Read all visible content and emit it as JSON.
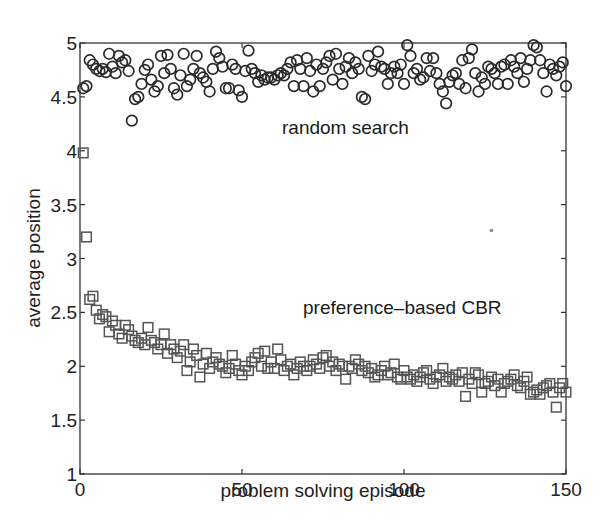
{
  "chart_data": {
    "type": "scatter",
    "title": "",
    "xlabel": "problem solving episode",
    "ylabel": "average position",
    "xlim": [
      0,
      150
    ],
    "ylim": [
      1,
      5
    ],
    "xticks": [
      0,
      50,
      100,
      150
    ],
    "yticks": [
      1,
      1.5,
      2,
      2.5,
      3,
      3.5,
      4,
      4.5,
      5
    ],
    "ytick_labels": [
      "1",
      "1.5",
      "2",
      "2.5",
      "3",
      "3.5",
      "4",
      "4.5",
      "5"
    ],
    "xtick_labels": [
      "0",
      "50",
      "100",
      "150"
    ],
    "grid": false,
    "legend": "none (inline annotations)",
    "annotations": [
      {
        "text": "random search",
        "x": 45,
        "y": 4.03
      },
      {
        "text": "preference–based CBR",
        "x": 65,
        "y": 2.28
      }
    ],
    "series": [
      {
        "name": "random search",
        "marker": "circle",
        "color": "#2a2a2a",
        "x": [
          1,
          2,
          3,
          4,
          5,
          6,
          7,
          8,
          9,
          10,
          11,
          12,
          13,
          14,
          15,
          16,
          17,
          18,
          19,
          20,
          21,
          22,
          23,
          24,
          25,
          26,
          27,
          28,
          29,
          30,
          31,
          32,
          33,
          34,
          35,
          36,
          37,
          38,
          39,
          40,
          41,
          42,
          43,
          44,
          45,
          46,
          47,
          48,
          49,
          50,
          51,
          52,
          53,
          54,
          55,
          56,
          57,
          58,
          59,
          60,
          61,
          62,
          63,
          64,
          65,
          66,
          67,
          68,
          69,
          70,
          71,
          72,
          73,
          74,
          75,
          76,
          77,
          78,
          79,
          80,
          81,
          82,
          83,
          84,
          85,
          86,
          87,
          88,
          89,
          90,
          91,
          92,
          93,
          94,
          95,
          96,
          97,
          98,
          99,
          100,
          101,
          102,
          103,
          104,
          105,
          106,
          107,
          108,
          109,
          110,
          111,
          112,
          113,
          114,
          115,
          116,
          117,
          118,
          119,
          120,
          121,
          122,
          123,
          124,
          125,
          126,
          127,
          128,
          129,
          130,
          131,
          132,
          133,
          134,
          135,
          136,
          137,
          138,
          139,
          140,
          141,
          142,
          143,
          144,
          145,
          146,
          147,
          148,
          149,
          150
        ],
        "y": [
          4.58,
          4.6,
          4.84,
          4.8,
          4.76,
          4.74,
          4.76,
          4.73,
          4.9,
          4.78,
          4.72,
          4.88,
          4.82,
          4.84,
          4.74,
          4.28,
          4.48,
          4.5,
          4.62,
          4.75,
          4.8,
          4.66,
          4.55,
          4.6,
          4.88,
          4.72,
          4.89,
          4.76,
          4.58,
          4.52,
          4.7,
          4.9,
          4.6,
          4.66,
          4.76,
          4.88,
          4.72,
          4.68,
          4.64,
          4.55,
          4.76,
          4.92,
          4.86,
          4.78,
          4.58,
          4.58,
          4.8,
          4.76,
          4.56,
          4.5,
          4.74,
          4.93,
          4.76,
          4.72,
          4.64,
          4.7,
          4.66,
          4.68,
          4.68,
          4.66,
          4.7,
          4.72,
          4.7,
          4.76,
          4.82,
          4.6,
          4.84,
          4.76,
          4.6,
          4.86,
          4.74,
          4.55,
          4.8,
          4.6,
          4.76,
          4.82,
          4.88,
          4.66,
          4.9,
          4.76,
          4.62,
          4.78,
          4.86,
          4.72,
          4.82,
          4.76,
          4.5,
          4.48,
          4.88,
          4.74,
          4.8,
          4.92,
          4.78,
          4.76,
          4.62,
          4.72,
          4.78,
          4.72,
          4.8,
          4.62,
          4.98,
          4.88,
          4.72,
          4.76,
          4.66,
          4.68,
          4.86,
          4.74,
          4.86,
          4.72,
          4.62,
          4.55,
          4.44,
          4.64,
          4.7,
          4.72,
          4.62,
          4.84,
          4.58,
          4.86,
          4.94,
          4.72,
          4.55,
          4.68,
          4.62,
          4.78,
          4.76,
          4.72,
          4.62,
          4.78,
          4.8,
          4.62,
          4.84,
          4.78,
          4.72,
          4.86,
          4.64,
          4.76,
          4.84,
          4.98,
          4.96,
          4.84,
          4.72,
          4.55,
          4.8,
          4.76,
          4.7,
          4.78,
          4.82,
          4.6
        ],
        "y_range_observed": [
          4.28,
          5.0
        ]
      },
      {
        "name": "preference-based CBR",
        "marker": "square",
        "color": "#555555",
        "x": [
          1,
          2,
          3,
          4,
          5,
          6,
          7,
          8,
          9,
          10,
          11,
          12,
          13,
          14,
          15,
          16,
          17,
          18,
          19,
          20,
          21,
          22,
          23,
          24,
          25,
          26,
          27,
          28,
          29,
          30,
          31,
          32,
          33,
          34,
          35,
          36,
          37,
          38,
          39,
          40,
          41,
          42,
          43,
          44,
          45,
          46,
          47,
          48,
          49,
          50,
          51,
          52,
          53,
          54,
          55,
          56,
          57,
          58,
          59,
          60,
          61,
          62,
          63,
          64,
          65,
          66,
          67,
          68,
          69,
          70,
          71,
          72,
          73,
          74,
          75,
          76,
          77,
          78,
          79,
          80,
          81,
          82,
          83,
          84,
          85,
          86,
          87,
          88,
          89,
          90,
          91,
          92,
          93,
          94,
          95,
          96,
          97,
          98,
          99,
          100,
          101,
          102,
          103,
          104,
          105,
          106,
          107,
          108,
          109,
          110,
          111,
          112,
          113,
          114,
          115,
          116,
          117,
          118,
          119,
          120,
          121,
          122,
          123,
          124,
          125,
          126,
          127,
          128,
          129,
          130,
          131,
          132,
          133,
          134,
          135,
          136,
          137,
          138,
          139,
          140,
          141,
          142,
          143,
          144,
          145,
          146,
          147,
          148,
          149,
          150
        ],
        "y": [
          3.98,
          3.2,
          2.62,
          2.65,
          2.52,
          2.44,
          2.48,
          2.46,
          2.32,
          2.42,
          2.38,
          2.3,
          2.26,
          2.38,
          2.34,
          2.28,
          2.24,
          2.22,
          2.26,
          2.2,
          2.36,
          2.24,
          2.22,
          2.16,
          2.2,
          2.3,
          2.12,
          2.2,
          2.16,
          2.08,
          2.14,
          2.2,
          1.96,
          2.04,
          2.16,
          2.1,
          1.9,
          2.02,
          2.12,
          1.98,
          2.04,
          2.08,
          2.02,
          2.0,
          1.94,
          1.98,
          2.1,
          2.02,
          1.96,
          1.92,
          2.0,
          1.96,
          2.04,
          2.08,
          2.12,
          2.0,
          2.14,
          1.98,
          2.04,
          1.98,
          2.16,
          2.06,
          1.96,
          2.0,
          2.02,
          1.92,
          1.98,
          2.04,
          2.0,
          1.96,
          2.0,
          2.06,
          2.02,
          1.98,
          2.08,
          2.1,
          2.0,
          2.04,
          1.96,
          2.02,
          2.0,
          1.88,
          2.0,
          1.98,
          2.06,
          2.02,
          1.96,
          2.0,
          1.94,
          1.98,
          1.9,
          1.92,
          1.96,
          2.0,
          1.92,
          1.94,
          2.02,
          1.9,
          1.88,
          1.96,
          1.9,
          1.88,
          1.92,
          1.86,
          1.9,
          1.94,
          1.96,
          1.88,
          1.84,
          1.9,
          1.92,
          1.98,
          1.86,
          1.9,
          1.88,
          1.92,
          1.86,
          1.94,
          1.72,
          1.88,
          1.84,
          1.94,
          1.92,
          1.76,
          1.84,
          1.86,
          1.9,
          1.82,
          1.88,
          1.76,
          1.84,
          1.86,
          1.88,
          1.92,
          1.82,
          1.8,
          1.86,
          1.9,
          1.74,
          1.76,
          1.78,
          1.74,
          1.8,
          1.82,
          1.84,
          1.76,
          1.62,
          1.8,
          1.84,
          1.76
        ],
        "y_range_observed": [
          1.62,
          3.98
        ]
      }
    ]
  },
  "layout": {
    "plot_px": {
      "left": 80,
      "right": 566,
      "top": 43,
      "bottom": 474
    },
    "stray_dot": {
      "x": 127,
      "y": 3.26,
      "color": "#888888"
    }
  }
}
